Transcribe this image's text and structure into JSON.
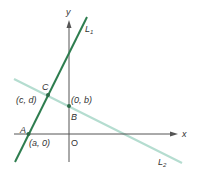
{
  "diagram": {
    "axes": {
      "x_label": "x",
      "y_label": "y",
      "origin_label": "O",
      "color": "#555555"
    },
    "lines": [
      {
        "name": "L1",
        "label": "L",
        "subscript": "1",
        "color": "#2e7d4f"
      },
      {
        "name": "L2",
        "label": "L",
        "subscript": "2",
        "color": "#b5ddd0"
      }
    ],
    "points": [
      {
        "name": "A",
        "label": "A",
        "coords": "(a, 0)"
      },
      {
        "name": "B",
        "label": "B",
        "coords": "(0, b)"
      },
      {
        "name": "C",
        "label": "C",
        "coords": "(c, d)"
      }
    ],
    "point_color": "#2e6b48"
  }
}
